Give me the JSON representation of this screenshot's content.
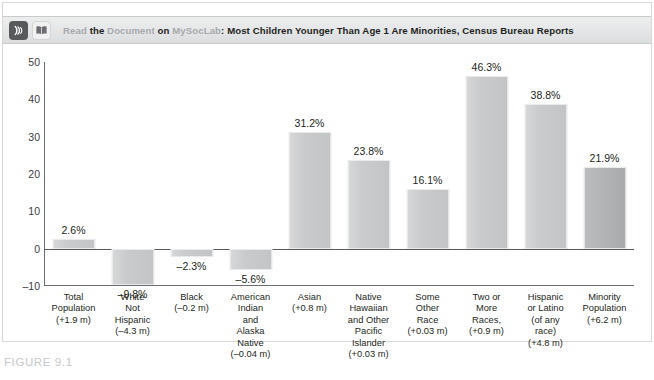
{
  "banner": {
    "read_label": "Read",
    "the_label": "the",
    "document_label": "Document",
    "on_label": "on",
    "mysoclab_label": "MySocLab",
    "colon": ":",
    "headline": "Most Children Younger Than Age 1 Are Minorities, Census Bureau Reports",
    "audio_icon_name": "audio-icon",
    "book_icon_name": "book-icon"
  },
  "caption": {
    "figure_label": "FIGURE 9.1"
  },
  "chart_data": {
    "type": "bar",
    "title": "",
    "xlabel": "",
    "ylabel": "",
    "ylim": [
      -10,
      50
    ],
    "yticks": [
      50,
      40,
      30,
      20,
      10,
      0,
      -10
    ],
    "ytick_labels": [
      "50",
      "40",
      "30",
      "20",
      "10",
      "0",
      "–10"
    ],
    "grid": false,
    "legend": "none",
    "bar_color": "#c9cacc",
    "categories": [
      "Total Population",
      "White Not Hispanic",
      "Black",
      "American Indian and Alaska Native",
      "Asian",
      "Native Hawaiian and Other Pacific Islander",
      "Some Other Race",
      "Two or More Races,",
      "Hispanic or Latino (of any race)",
      "Minority Population"
    ],
    "category_lines": [
      [
        "Total",
        "Population",
        "(+1.9 m)"
      ],
      [
        "White",
        "Not",
        "Hispanic",
        "(–4.3 m)"
      ],
      [
        "Black",
        "(–0.2 m)"
      ],
      [
        "American",
        "Indian",
        "and",
        "Alaska",
        "Native",
        "(–0.04 m)"
      ],
      [
        "Asian",
        "(+0.8 m)"
      ],
      [
        "Native",
        "Hawaiian",
        "and Other",
        "Pacific",
        "Islander",
        "(+0.03 m)"
      ],
      [
        "Some",
        "Other",
        "Race",
        "(+0.03 m)"
      ],
      [
        "Two or",
        "More",
        "Races,",
        "(+0.9 m)"
      ],
      [
        "Hispanic",
        "or Latino",
        "(of any",
        "race)",
        "(+4.8 m)"
      ],
      [
        "Minority",
        "Population",
        "(+6.2 m)"
      ]
    ],
    "values": [
      2.6,
      -9.8,
      -2.3,
      -5.6,
      31.2,
      23.8,
      16.1,
      46.3,
      38.8,
      21.9
    ],
    "value_labels": [
      "2.6%",
      "–9.8%",
      "–2.3%",
      "–5.6%",
      "31.2%",
      "23.8%",
      "16.1%",
      "46.3%",
      "38.8%",
      "21.9%"
    ],
    "population_changes": [
      "+1.9 m",
      "–4.3 m",
      "–0.2 m",
      "–0.04 m",
      "+0.8 m",
      "+0.03 m",
      "+0.03 m",
      "+0.9 m",
      "+4.8 m",
      "+6.2 m"
    ]
  }
}
